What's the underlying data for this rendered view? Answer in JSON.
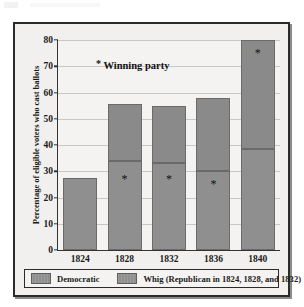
{
  "chart_data": {
    "type": "bar",
    "stacked": true,
    "title": "",
    "xlabel": "",
    "ylabel": "Percentage of eligible voters who cast ballots",
    "ylim": [
      0,
      80
    ],
    "ytick_step": 10,
    "yticks": [
      "0",
      "10",
      "20",
      "30",
      "40",
      "50",
      "60",
      "70",
      "80"
    ],
    "grid": true,
    "categories": [
      "1824",
      "1828",
      "1832",
      "1836",
      "1840"
    ],
    "series": [
      {
        "name": "Democratic",
        "values": [
          27.4,
          34.0,
          33.2,
          30.2,
          38.6
        ]
      },
      {
        "name": "Whig (Republican in 1824, 1828, and 1832)",
        "values": [
          0,
          21.6,
          21.6,
          27.8,
          41.4
        ]
      }
    ],
    "totals": [
      27.4,
      55.6,
      54.8,
      58.0,
      80.0
    ],
    "annotation": {
      "marker": "*",
      "label": "Winning party",
      "winners": [
        {
          "year": "1824",
          "party": "",
          "marker_value": null
        },
        {
          "year": "1828",
          "party": "Democratic",
          "marker_value": 27
        },
        {
          "year": "1832",
          "party": "Democratic",
          "marker_value": 27
        },
        {
          "year": "1836",
          "party": "Democratic",
          "marker_value": 25
        },
        {
          "year": "1840",
          "party": "Whig",
          "marker_value": 75
        }
      ]
    },
    "legend": {
      "position": "bottom",
      "entries": [
        {
          "label": "Democratic",
          "color": "#8f8f8f"
        },
        {
          "label": "Whig (Republican in 1824, 1828, and 1832)",
          "color": "#8a8a8a"
        }
      ]
    },
    "colors": {
      "democratic": "#8f8f8f",
      "whig": "#8a8a8a",
      "plot_background": "#f4f3f1",
      "figure_background": "#f1f0ee",
      "axis": "#333333",
      "gridline": "#c9c7c4"
    }
  }
}
